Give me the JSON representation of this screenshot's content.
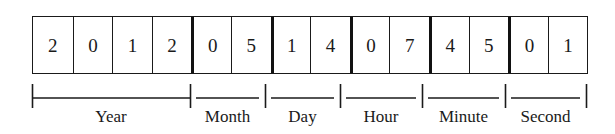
{
  "diagram": {
    "encoded_value": "20120514074501",
    "colors": {
      "ink": "#1a1a1a",
      "group_divider": "#111111",
      "background": "#ffffff"
    },
    "cells": [
      {
        "digit": "2",
        "group": "year",
        "group_start": true
      },
      {
        "digit": "0",
        "group": "year",
        "group_start": false
      },
      {
        "digit": "1",
        "group": "year",
        "group_start": false
      },
      {
        "digit": "2",
        "group": "year",
        "group_start": false
      },
      {
        "digit": "0",
        "group": "month",
        "group_start": true
      },
      {
        "digit": "5",
        "group": "month",
        "group_start": false
      },
      {
        "digit": "1",
        "group": "day",
        "group_start": true
      },
      {
        "digit": "4",
        "group": "day",
        "group_start": false
      },
      {
        "digit": "0",
        "group": "hour",
        "group_start": true
      },
      {
        "digit": "7",
        "group": "hour",
        "group_start": false
      },
      {
        "digit": "4",
        "group": "minute",
        "group_start": true
      },
      {
        "digit": "5",
        "group": "minute",
        "group_start": false
      },
      {
        "digit": "0",
        "group": "second",
        "group_start": true
      },
      {
        "digit": "1",
        "group": "second",
        "group_start": false
      }
    ],
    "groups": [
      {
        "key": "year",
        "label": "Year",
        "value": "2012",
        "digits": 4,
        "start_x": 32,
        "end_x": 190
      },
      {
        "key": "month",
        "label": "Month",
        "value": "05",
        "digits": 2,
        "start_x": 190,
        "end_x": 265
      },
      {
        "key": "day",
        "label": "Day",
        "value": "14",
        "digits": 2,
        "start_x": 265,
        "end_x": 340
      },
      {
        "key": "hour",
        "label": "Hour",
        "value": "07",
        "digits": 2,
        "start_x": 340,
        "end_x": 422
      },
      {
        "key": "minute",
        "label": "Minute",
        "value": "45",
        "digits": 2,
        "start_x": 422,
        "end_x": 505
      },
      {
        "key": "second",
        "label": "Second",
        "value": "01",
        "digits": 2,
        "start_x": 505,
        "end_x": 586
      }
    ]
  }
}
